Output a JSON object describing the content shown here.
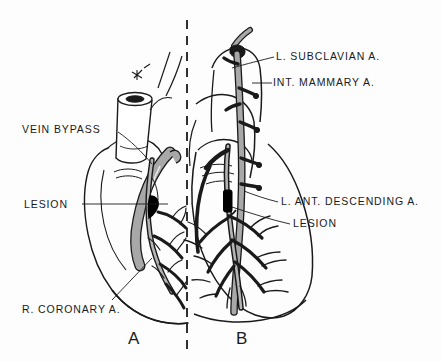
{
  "figure": {
    "background_color": "#fdfdfd",
    "ink_color": "#1a1a1a",
    "graft_fill_color": "#a8a8a8",
    "lesion_color": "#000000",
    "width": 442,
    "height": 362
  },
  "divider": {
    "name": "dashed-center-divider",
    "style": "dashed",
    "x": 187,
    "y_start": 20,
    "y_end": 352
  },
  "panels": [
    {
      "id": "A",
      "letter": "A",
      "x": 128,
      "y": 330,
      "side": "left",
      "description": "Saphenous vein bypass graft to right coronary artery"
    },
    {
      "id": "B",
      "letter": "B",
      "x": 236,
      "y": 330,
      "side": "right",
      "description": "Internal mammary artery graft to left anterior descending artery"
    }
  ],
  "labels": [
    {
      "id": "vein-bypass",
      "text": "VEIN BYPASS",
      "x": 22,
      "y": 124,
      "align": "left",
      "side": "left",
      "leader": {
        "from": [
          118,
          132
        ],
        "to": [
          150,
          164
        ]
      }
    },
    {
      "id": "lesion-left",
      "text": "LESION",
      "x": 24,
      "y": 199,
      "align": "left",
      "side": "left",
      "leader": {
        "from": [
          82,
          204
        ],
        "to": [
          168,
          204
        ]
      }
    },
    {
      "id": "r-coronary-a",
      "text": "R. CORONARY A.",
      "x": 22,
      "y": 304,
      "align": "left",
      "side": "left",
      "leader": {
        "from": [
          112,
          300
        ],
        "to": [
          152,
          258
        ]
      }
    },
    {
      "id": "l-subclavian-a",
      "text": "L. SUBCLAVIAN A.",
      "x": 276,
      "y": 51,
      "align": "left",
      "side": "right",
      "leader": {
        "from": [
          274,
          57
        ],
        "to": [
          232,
          68
        ]
      }
    },
    {
      "id": "int-mammary-a",
      "text": "INT. MAMMARY A.",
      "x": 273,
      "y": 77,
      "align": "left",
      "side": "right",
      "leader": {
        "from": [
          272,
          83
        ],
        "to": [
          256,
          83
        ]
      }
    },
    {
      "id": "l-ant-descending-a",
      "text": "L. ANT. DESCENDING A.",
      "x": 281,
      "y": 196,
      "align": "left",
      "side": "right",
      "leader": {
        "from": [
          278,
          202
        ],
        "to": [
          246,
          192
        ]
      }
    },
    {
      "id": "lesion-right",
      "text": "LESION",
      "x": 293,
      "y": 218,
      "align": "left",
      "side": "right",
      "leader": {
        "from": [
          290,
          224
        ],
        "to": [
          232,
          208
        ]
      }
    }
  ],
  "anatomy": {
    "left_panel": [
      "heart-silhouette-left",
      "aorta-stump",
      "saphenous-vein-graft",
      "right-coronary-artery",
      "coronary-lesion-occlusion",
      "distal-coronary-branches"
    ],
    "right_panel": [
      "heart-silhouette-right",
      "aortic-arch",
      "left-subclavian-artery",
      "internal-mammary-artery",
      "left-anterior-descending-artery",
      "lad-lesion-occlusion",
      "diagonal-branches"
    ]
  }
}
